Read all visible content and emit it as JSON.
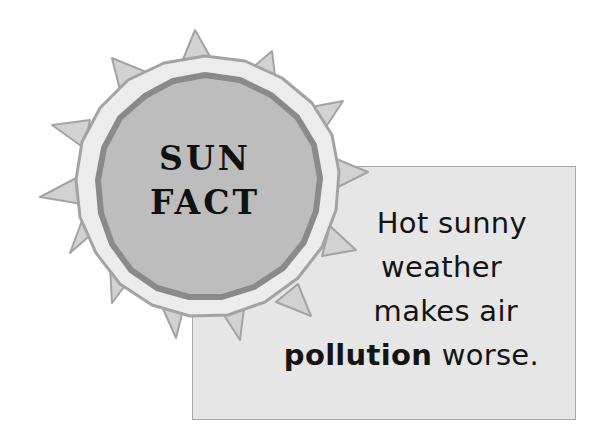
{
  "badge": {
    "title_line1": "SUN",
    "title_line2": "FACT"
  },
  "fact": {
    "line1": "Hot sunny",
    "line2": "weather",
    "line3": "makes air",
    "line4_bold": "pollution",
    "line4_rest": " worse."
  },
  "colors": {
    "box_fill": "#e6e6e6",
    "box_border": "#a9a9a9",
    "sun_inner": "#bdbdbd",
    "sun_dark_ring": "#8a8a8a",
    "sun_light_ring": "#ececec",
    "sun_outline": "#a3a3a3",
    "ray_fill": "#d2d2d2",
    "text": "#141414"
  }
}
